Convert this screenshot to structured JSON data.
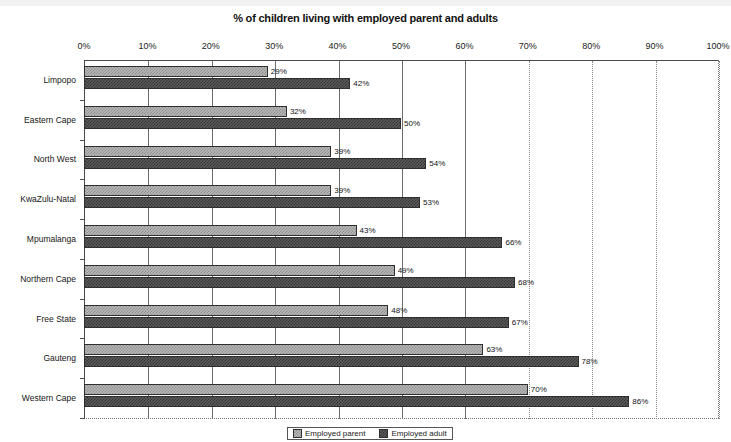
{
  "chart_data": {
    "type": "bar",
    "orientation": "horizontal",
    "title": "% of children living with employed parent and adults",
    "xlabel": "",
    "ylabel": "",
    "xlim": [
      0,
      100
    ],
    "xtick_labels": [
      "0%",
      "10%",
      "20%",
      "30%",
      "40%",
      "50%",
      "60%",
      "70%",
      "80%",
      "90%",
      "100%"
    ],
    "xticks": [
      0,
      10,
      20,
      30,
      40,
      50,
      60,
      70,
      80,
      90,
      100
    ],
    "grid": true,
    "legend_position": "bottom",
    "categories": [
      "Limpopo",
      "Eastern Cape",
      "North West",
      "KwaZulu-Natal",
      "Mpumalanga",
      "Northern Cape",
      "Free State",
      "Gauteng",
      "Western Cape"
    ],
    "series": [
      {
        "name": "Employed parent",
        "values": [
          29,
          32,
          39,
          39,
          43,
          49,
          48,
          63,
          70
        ],
        "labels": [
          "29%",
          "32%",
          "39%",
          "39%",
          "43%",
          "49%",
          "48%",
          "63%",
          "70%"
        ],
        "color": "#b9b9b9"
      },
      {
        "name": "Employed adult",
        "values": [
          42,
          50,
          54,
          53,
          66,
          68,
          67,
          78,
          86
        ],
        "labels": [
          "42%",
          "50%",
          "54%",
          "53%",
          "66%",
          "68%",
          "67%",
          "78%",
          "86%"
        ],
        "color": "#5d5d5d"
      }
    ]
  },
  "legend": {
    "items": [
      {
        "label": "Employed parent"
      },
      {
        "label": "Employed adult"
      }
    ]
  }
}
